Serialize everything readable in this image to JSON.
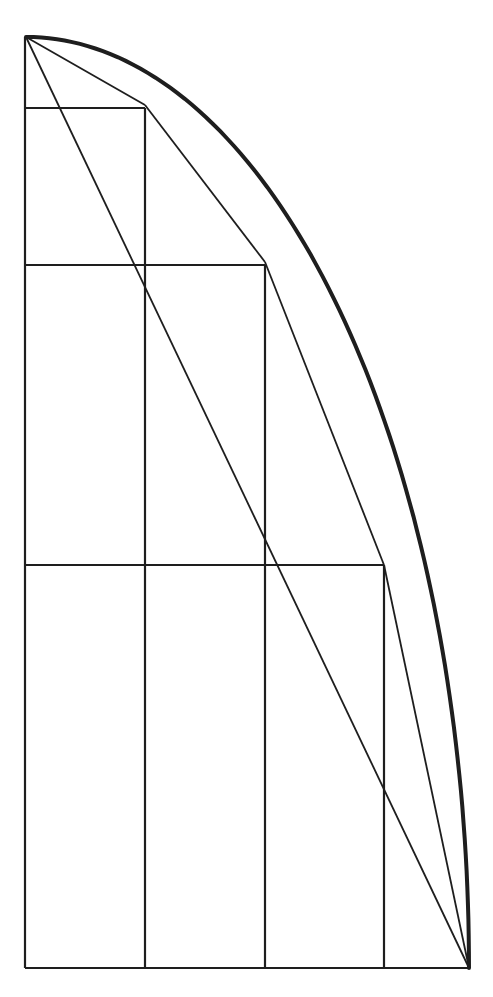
{
  "diagram": {
    "colors": {
      "stroke": "#1e1e1e",
      "background": "#ffffff"
    },
    "frame": {
      "left": 25,
      "bottom": 968,
      "top": 37,
      "right": 469
    },
    "curve_points": [
      [
        26,
        37
      ],
      [
        145,
        105
      ],
      [
        265,
        262
      ],
      [
        384,
        565
      ],
      [
        469,
        968
      ]
    ],
    "vertical_lines_x": [
      25,
      145,
      265,
      384
    ],
    "horizontal_lines": [
      {
        "y": 108,
        "x1": 25,
        "x2": 145
      },
      {
        "y": 265,
        "x1": 25,
        "x2": 265
      },
      {
        "y": 565,
        "x1": 25,
        "x2": 384
      },
      {
        "y": 968,
        "x1": 25,
        "x2": 469
      }
    ],
    "diagonal": {
      "x1": 26,
      "y1": 37,
      "x2": 469,
      "y2": 968
    }
  }
}
